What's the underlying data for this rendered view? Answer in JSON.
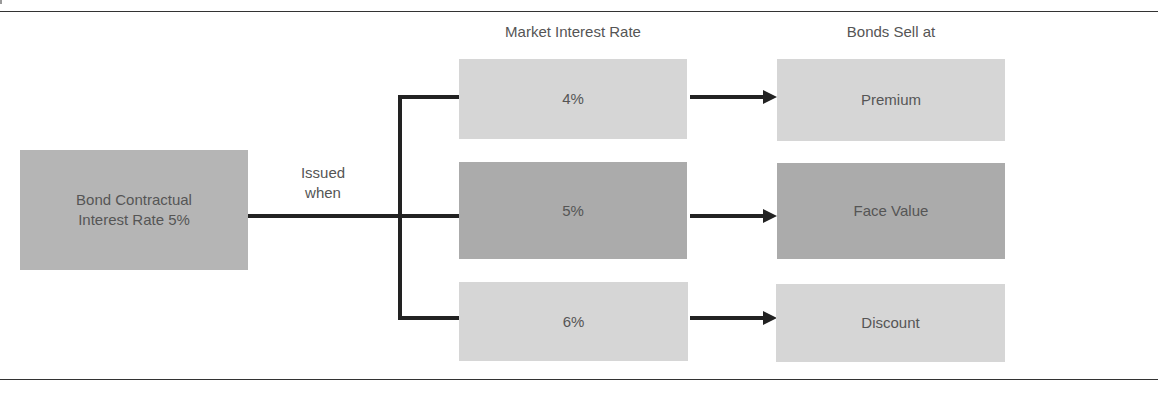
{
  "diagram": {
    "source": {
      "text_line1": "Bond Contractual",
      "text_line2": "Interest Rate 5%"
    },
    "connector_label": {
      "line1": "Issued",
      "line2": "when"
    },
    "column_headers": {
      "market_rate": "Market Interest Rate",
      "sell_at": "Bonds Sell at"
    },
    "rows": [
      {
        "rate": "4%",
        "outcome": "Premium"
      },
      {
        "rate": "5%",
        "outcome": "Face Value"
      },
      {
        "rate": "6%",
        "outcome": "Discount"
      }
    ],
    "colors": {
      "light_box": "#d6d6d6",
      "dark_box": "#ababab",
      "source_box": "#b5b5b5",
      "line": "#222222",
      "text": "#555555"
    }
  }
}
